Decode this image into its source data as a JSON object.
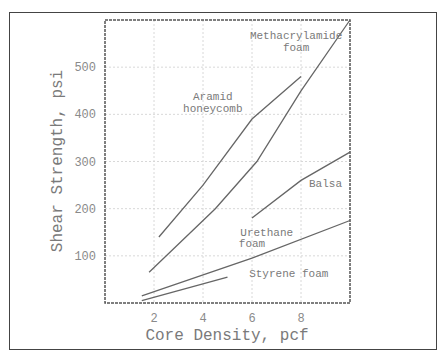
{
  "chart_data": {
    "type": "line",
    "title": "",
    "xlabel": "Core Density, pcf",
    "ylabel": "Shear Strength, psi",
    "xlim": [
      0,
      10
    ],
    "ylim": [
      0,
      600
    ],
    "x_ticks": [
      "2",
      "4",
      "6",
      "8"
    ],
    "y_ticks": [
      "100",
      "200",
      "300",
      "400",
      "500"
    ],
    "grid": true,
    "legend": "inline annotations",
    "series": [
      {
        "name": "Aramid honeycomb",
        "x": [
          2.2,
          4,
          6,
          8
        ],
        "y": [
          140,
          250,
          390,
          480
        ]
      },
      {
        "name": "Methacrylamide foam",
        "x": [
          1.8,
          4.5,
          6.2,
          8,
          10
        ],
        "y": [
          65,
          200,
          300,
          450,
          600
        ]
      },
      {
        "name": "Balsa",
        "x": [
          6,
          8,
          10
        ],
        "y": [
          180,
          260,
          320
        ]
      },
      {
        "name": "Urethane foam",
        "x": [
          1.5,
          6,
          10
        ],
        "y": [
          15,
          95,
          175
        ]
      },
      {
        "name": "Styrene foam",
        "x": [
          1.5,
          5
        ],
        "y": [
          5,
          55
        ]
      }
    ],
    "annotations": [
      {
        "text": "Methacrylamide",
        "x": 7.8,
        "y": 560
      },
      {
        "text": "foam",
        "x": 7.8,
        "y": 535
      },
      {
        "text": "Aramid",
        "x": 4.4,
        "y": 430
      },
      {
        "text": "honeycomb",
        "x": 4.4,
        "y": 405
      },
      {
        "text": "Balsa",
        "x": 9,
        "y": 245
      },
      {
        "text": "Urethane",
        "x": 6.6,
        "y": 143
      },
      {
        "text": "foam",
        "x": 6.0,
        "y": 118
      },
      {
        "text": "Styrene foam",
        "x": 7.5,
        "y": 55
      }
    ]
  }
}
